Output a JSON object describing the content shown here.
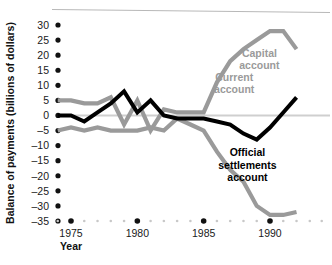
{
  "chart_data": {
    "type": "line",
    "title": "",
    "xlabel": "Year",
    "ylabel": "Balance of payments (billions of dollars)",
    "xlim": [
      1973.5,
      1992.5
    ],
    "ylim": [
      -35,
      30
    ],
    "ytick_labels": [
      "30",
      "25",
      "20",
      "15",
      "10",
      "5",
      "0",
      "–5",
      "–10",
      "–15",
      "–20",
      "–25",
      "–30",
      "–35"
    ],
    "ytick_values": [
      30,
      25,
      20,
      15,
      10,
      5,
      0,
      -5,
      -10,
      -15,
      -20,
      -25,
      -30,
      -35
    ],
    "xtick_labels": [
      "1975",
      "1980",
      "1985",
      "1990"
    ],
    "xtick_values": [
      1975,
      1980,
      1985,
      1990
    ],
    "grid": false,
    "legend_position": "inline-annotations",
    "zero_line": 0,
    "colors": {
      "capital": "#9a9a9a",
      "current": "#9a9a9a",
      "official": "#000000",
      "zero_line": "#cfcfcf",
      "axis_dots": "#111111",
      "minor_dots": "#c8c8c8",
      "top_rule": "#b8b8b8"
    },
    "series": [
      {
        "name": "Capital account",
        "color": "#9a9a9a",
        "label_x": 1989.2,
        "label_y": 19.5,
        "x": [
          1974,
          1975,
          1976,
          1977,
          1978,
          1979,
          1980,
          1981,
          1982,
          1983,
          1984,
          1985,
          1986,
          1987,
          1988,
          1989,
          1990,
          1991,
          1992
        ],
        "values": [
          5,
          5,
          4,
          4,
          6,
          -3,
          5,
          -5,
          2,
          1,
          1,
          1,
          11,
          18,
          22,
          25,
          28,
          28,
          22
        ]
      },
      {
        "name": "Current account",
        "color": "#9a9a9a",
        "label_x": 1988.3,
        "label_y": -13.5,
        "x": [
          1974,
          1975,
          1976,
          1977,
          1978,
          1979,
          1980,
          1981,
          1982,
          1983,
          1984,
          1985,
          1986,
          1987,
          1988,
          1989,
          1990,
          1991,
          1992
        ],
        "values": [
          -5,
          -4,
          -5,
          -4,
          -5,
          -5,
          -5,
          -4,
          -5,
          -1,
          -3,
          -5,
          -12,
          -18,
          -22,
          -30,
          -33,
          -33,
          -32
        ]
      },
      {
        "name": "Official settlements account",
        "color": "#000000",
        "label_x": 1987.3,
        "label_y": 11.5,
        "x": [
          1974,
          1975,
          1976,
          1977,
          1978,
          1979,
          1980,
          1981,
          1982,
          1983,
          1984,
          1985,
          1986,
          1987,
          1988,
          1989,
          1990,
          1991,
          1992
        ],
        "values": [
          0,
          0,
          -2,
          1,
          4,
          8,
          1,
          5,
          0,
          -1,
          -1,
          -1,
          -2,
          -3,
          -6,
          -8,
          -4,
          1,
          6
        ]
      }
    ],
    "annotations": [
      {
        "name": "capital-account-label",
        "lines": [
          "Capital",
          "account"
        ],
        "style": "gray"
      },
      {
        "name": "official-settlements-account-label",
        "lines": [
          "Official",
          "settlements",
          "account"
        ],
        "style": "black"
      },
      {
        "name": "current-account-label",
        "lines": [
          "Current",
          "account"
        ],
        "style": "gray"
      }
    ]
  }
}
